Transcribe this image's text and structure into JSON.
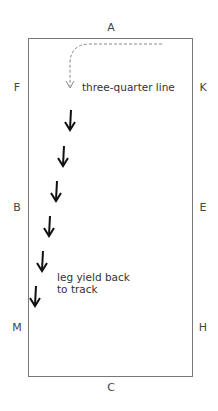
{
  "diagram": {
    "markers": {
      "A": "A",
      "K": "K",
      "E": "E",
      "H": "H",
      "C": "C",
      "M": "M",
      "B": "B",
      "F": "F"
    },
    "labels": {
      "start": "three-quarter line",
      "end_line1": "leg yield back",
      "end_line2": "to track"
    },
    "path": {
      "turn_style": "dashed",
      "arrow_count": 6,
      "arrow_direction": "down-diagonal toward left track"
    },
    "colors": {
      "border": "#777777",
      "dashed_path": "#888888",
      "arrow": "#111111",
      "text": "#333333"
    }
  }
}
